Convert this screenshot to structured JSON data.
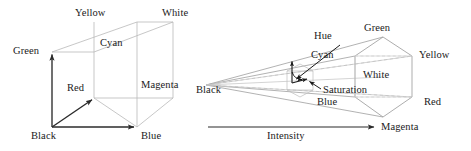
{
  "figure": {
    "colors": {
      "cube_edge": "#b3b3b3",
      "cube_edge_dark": "#3a3a3a",
      "axis_arrow": "#2b2b2b",
      "cone_edge": "#9a9a9a",
      "cone_edge_faint": "#c4c4c4",
      "dashed_edge": "#bdbdbd",
      "annotation": "#1a1a1a",
      "text": "#1a1a1a",
      "background": "#ffffff"
    }
  },
  "rgb_cube": {
    "name": "RGB colour cube",
    "labels": {
      "yellow": "Yellow",
      "white": "White",
      "cyan": "Cyan",
      "green": "Green",
      "magenta": "Magenta",
      "red": "Red",
      "black": "Black",
      "blue": "Blue"
    },
    "vertices": {
      "black": [
        52,
        127
      ],
      "blue": [
        137,
        127
      ],
      "red": [
        94,
        98
      ],
      "magenta": [
        173,
        98
      ],
      "green": [
        52,
        52
      ],
      "cyan": [
        94,
        52
      ],
      "yellow": [
        137,
        22
      ],
      "white": [
        173,
        22
      ]
    },
    "axes": [
      {
        "name": "green-axis",
        "from": "black",
        "to": "green"
      },
      {
        "name": "blue-axis",
        "from": "black",
        "to": "blue"
      },
      {
        "name": "red-axis",
        "from": "black",
        "to": "red"
      }
    ]
  },
  "hsi_cone": {
    "name": "HSI colour cone",
    "labels": {
      "hue": "Hue",
      "saturation": "Saturation",
      "intensity": "Intensity",
      "black": "Black",
      "green": "Green",
      "cyan": "Cyan",
      "yellow": "Yellow",
      "white": "White",
      "blue": "Blue",
      "red": "Red",
      "magenta": "Magenta"
    },
    "apex": [
      206,
      85
    ],
    "hexagon_vertices": {
      "green": [
        383,
        37
      ],
      "yellow": [
        412,
        56
      ],
      "red": [
        412,
        97
      ],
      "magenta": [
        383,
        117
      ],
      "blue": [
        355,
        97
      ],
      "cyan": [
        355,
        56
      ],
      "white": [
        383,
        77
      ]
    },
    "intensity_axis": {
      "from": [
        208,
        127
      ],
      "to": [
        377,
        127
      ]
    },
    "inner_hexagon_center": [
      300,
      80
    ]
  }
}
